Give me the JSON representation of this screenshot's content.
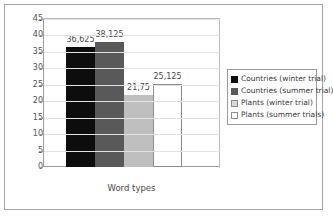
{
  "chart_data": {
    "type": "bar",
    "title": "",
    "xlabel": "Word types",
    "ylabel": "",
    "ylim": [
      0,
      45
    ],
    "ytick_step": 5,
    "yticks": [
      "45",
      "40",
      "35",
      "30",
      "25",
      "20",
      "15",
      "10",
      "5",
      "0"
    ],
    "grid": true,
    "legend_position": "right",
    "categories": [
      "Word types"
    ],
    "series": [
      {
        "name": "Countries (winter trial)",
        "label": "36,625",
        "value": 36.625,
        "color": "#0d0d0d",
        "border": "#0d0d0d"
      },
      {
        "name": "Countries (summer trial)",
        "label": "38,125",
        "value": 38.125,
        "color": "#595959",
        "border": "#595959"
      },
      {
        "name": "Plants (winter trial)",
        "label": "21,75",
        "value": 21.75,
        "color": "#bfbfbf",
        "border": "#bfbfbf"
      },
      {
        "name": "Plants (summer trials)",
        "label": "25,125",
        "value": 25.125,
        "color": "#ffffff",
        "border": "#8c8c8c"
      }
    ]
  },
  "legend": {
    "items": [
      {
        "label": "Countries (winter trial)",
        "color": "#0d0d0d",
        "border": "#0d0d0d"
      },
      {
        "label": "Countries (summer trial)",
        "color": "#595959",
        "border": "#595959"
      },
      {
        "label": "Plants (winter trial)",
        "color": "#d9d9d9",
        "border": "#8c8c8c"
      },
      {
        "label": "Plants (summer trials)",
        "color": "#ffffff",
        "border": "#8c8c8c"
      }
    ]
  }
}
